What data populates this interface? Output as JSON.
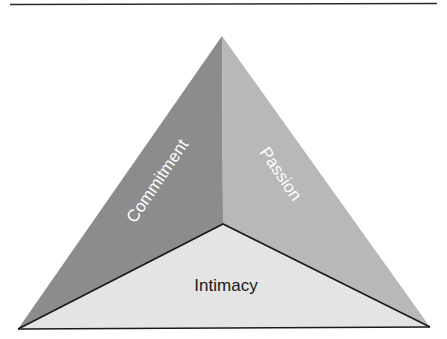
{
  "diagram": {
    "type": "triangle-pyramid",
    "title": "",
    "faces": [
      {
        "id": "commitment",
        "label": "Commitment",
        "position": "left",
        "fill": "#8c8c8c",
        "text_color": "#ffffff"
      },
      {
        "id": "passion",
        "label": "Passion",
        "position": "right",
        "fill": "#b8b8b8",
        "text_color": "#ffffff"
      },
      {
        "id": "intimacy",
        "label": "Intimacy",
        "position": "bottom",
        "fill": "#e4e4e4",
        "text_color": "#1a1a1a"
      }
    ],
    "colors": {
      "outline": "#1a1a1a",
      "rule": "#2a2a2a",
      "background": "#ffffff"
    }
  }
}
